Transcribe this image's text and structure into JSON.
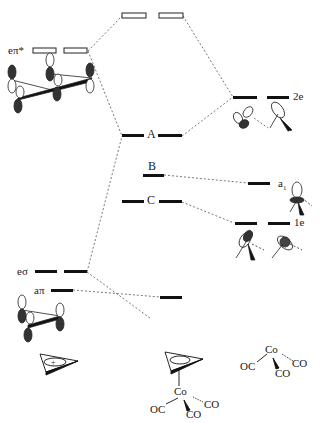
{
  "diagram": {
    "type": "MO energy level correlation diagram",
    "left_fragment": {
      "name": "cyclopropenyl (C3H3+)",
      "levels": [
        {
          "label": "eπ*",
          "degenerate": true,
          "occupied": false
        },
        {
          "label": "eσ",
          "degenerate": true,
          "occupied": true
        },
        {
          "label": "aπ",
          "degenerate": false,
          "occupied": true
        }
      ],
      "ring_charge": "+"
    },
    "complex_levels": [
      {
        "label": "",
        "degenerate": true,
        "occupied": false,
        "note": "top antibonding"
      },
      {
        "label": "A",
        "degenerate": true,
        "occupied": true
      },
      {
        "label": "B",
        "degenerate": false,
        "occupied": true
      },
      {
        "label": "C",
        "degenerate": true,
        "occupied": true
      },
      {
        "label": "",
        "degenerate": false,
        "occupied": true,
        "note": "low level"
      }
    ],
    "right_fragment": {
      "name": "Co(CO)3",
      "levels": [
        {
          "label": "2e",
          "degenerate": true
        },
        {
          "label": "a1",
          "label_sub": "1",
          "label_main": "a",
          "degenerate": false
        },
        {
          "label": "1e",
          "degenerate": true
        }
      ],
      "formula": {
        "metal": "Co",
        "ligands": [
          "OC",
          "CO",
          "CO"
        ]
      }
    },
    "complex_structure": {
      "metal": "Co",
      "ligands": [
        "OC",
        "CO",
        "CO"
      ]
    }
  },
  "labels": {
    "epi_star": "eπ*",
    "esigma": "eσ",
    "api": "aπ",
    "A": "A",
    "B": "B",
    "C": "C",
    "two_e": "2e",
    "a1_main": "a",
    "a1_sub": "1",
    "one_e": "1e",
    "co": "Co",
    "oc": "OC",
    "co_ligand": "CO",
    "plus": "+"
  }
}
